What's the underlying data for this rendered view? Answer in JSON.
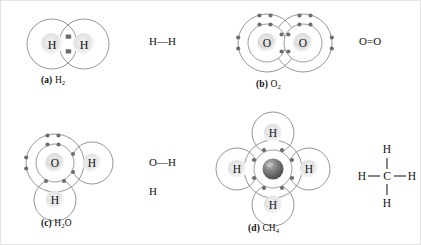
{
  "figure": {
    "background_color": "#ffffff",
    "shell_stroke": "#8a8a8a",
    "electron_color": "#6e6e6e",
    "atom_label_color": "#111111",
    "carbon_sphere_color": "#6b6b6b"
  },
  "panels": [
    {
      "id": "a",
      "tag": "(a)",
      "formula_text": "H",
      "formula_sub": "2",
      "caption_full": "(a) H2",
      "molecule": "hydrogen",
      "atoms": [
        {
          "symbol": "H",
          "shells": 1,
          "position": "left"
        },
        {
          "symbol": "H",
          "shells": 1,
          "position": "right"
        }
      ],
      "bond_type": "single",
      "shared_electrons": 2,
      "lone_pairs": 0,
      "structural_formula": "H—H",
      "structural_parts": {
        "left": "H",
        "bond": "—",
        "right": "H"
      }
    },
    {
      "id": "b",
      "tag": "(b)",
      "formula_text": "O",
      "formula_sub": "2",
      "caption_full": "(b) O2",
      "molecule": "oxygen",
      "atoms": [
        {
          "symbol": "O",
          "shells": 2,
          "position": "left"
        },
        {
          "symbol": "O",
          "shells": 2,
          "position": "right"
        }
      ],
      "bond_type": "double",
      "shared_electrons": 4,
      "lone_pairs_per_atom": 2,
      "structural_formula": "O=O",
      "structural_parts": {
        "left": "O",
        "bond": "=",
        "right": "O"
      }
    },
    {
      "id": "c",
      "tag": "(c)",
      "formula_text": "H",
      "formula_sub": "2",
      "formula_tail": "O",
      "caption_full": "(c) H2O",
      "molecule": "water",
      "atoms": [
        {
          "symbol": "O",
          "shells": 2,
          "position": "center"
        },
        {
          "symbol": "H",
          "shells": 1,
          "position": "right"
        },
        {
          "symbol": "H",
          "shells": 1,
          "position": "bottom"
        }
      ],
      "bond_type": "single",
      "shared_electrons": 4,
      "lone_pairs_on_oxygen": 2,
      "structural_formula": "O—H with H below O",
      "structural_parts": {
        "top_left": "O",
        "bond": "—",
        "top_right": "H",
        "bottom": "H"
      }
    },
    {
      "id": "d",
      "tag": "(d)",
      "formula_text": "CH",
      "formula_sub": "4",
      "caption_full": "(d) CH4",
      "molecule": "methane",
      "atoms": [
        {
          "symbol": "",
          "shells": 2,
          "position": "center",
          "note": "carbon-sphere"
        },
        {
          "symbol": "H",
          "shells": 1,
          "position": "top"
        },
        {
          "symbol": "H",
          "shells": 1,
          "position": "left"
        },
        {
          "symbol": "H",
          "shells": 1,
          "position": "right"
        },
        {
          "symbol": "H",
          "shells": 1,
          "position": "bottom"
        }
      ],
      "bond_type": "single",
      "shared_electrons": 8,
      "lone_pairs": 0,
      "structural_formula": "H—C—H with H above and below C",
      "structural_parts": {
        "top": "H",
        "left": "H",
        "center": "C",
        "right": "H",
        "bottom": "H",
        "bond": "—"
      }
    }
  ]
}
